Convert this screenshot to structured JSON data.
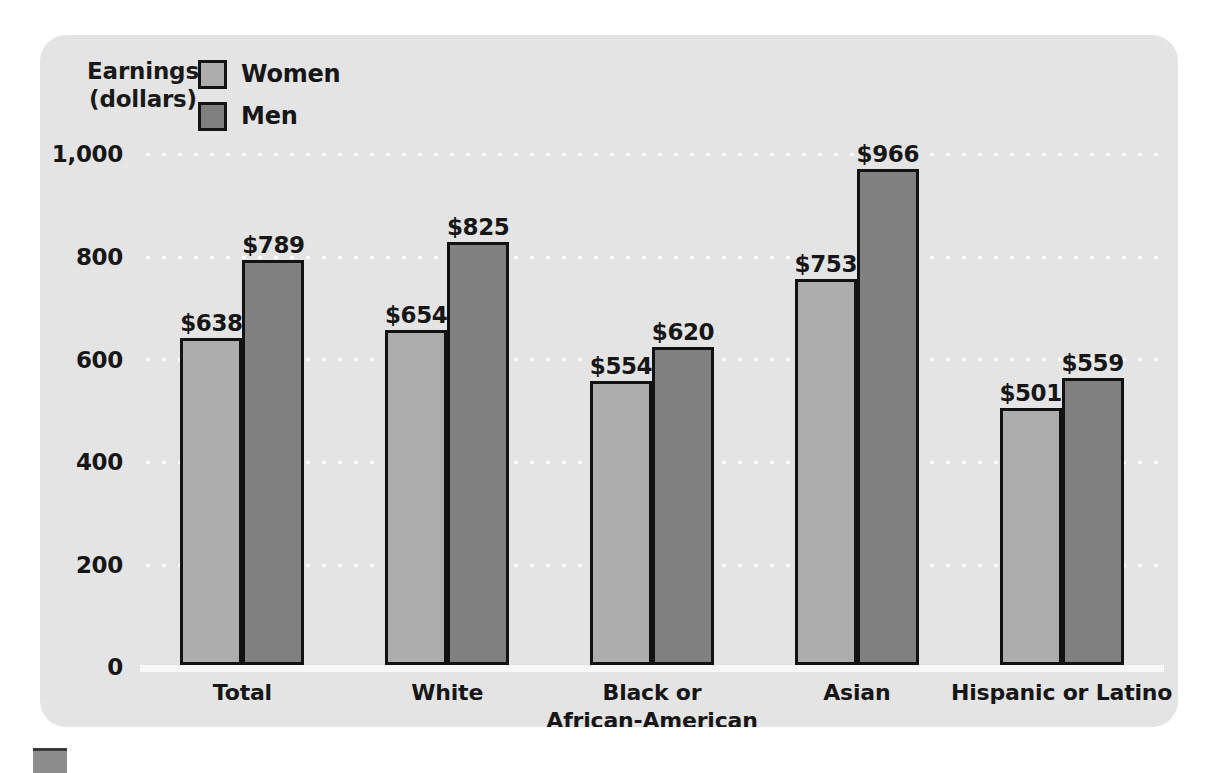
{
  "figure": {
    "panel_background": "#e7e7e7",
    "page_background": "#ffffff",
    "marker_name": "figure-bullet-marker"
  },
  "axis_title": {
    "line1": "Earnings",
    "line2": "(dollars)"
  },
  "legend": {
    "position": "top-left-inside",
    "items": [
      {
        "label": "Women",
        "color": "#afafaf",
        "border": "#101010"
      },
      {
        "label": "Men",
        "color": "#808080",
        "border": "#101010"
      }
    ]
  },
  "chart_data": {
    "type": "bar",
    "title": "",
    "subtitle": "",
    "xlabel": "",
    "ylabel": "Earnings (dollars)",
    "ylim": [
      0,
      1000
    ],
    "yticks": [
      "0",
      "200",
      "400",
      "600",
      "800",
      "1,000"
    ],
    "ytick_values": [
      0,
      200,
      400,
      600,
      800,
      1000
    ],
    "grid": true,
    "grid_style": "white-dotted-horizontal",
    "legend_position": "top-left",
    "categories": [
      "Total",
      "White",
      "Black or\nAfrican-American",
      "Asian",
      "Hispanic or Latino"
    ],
    "category_lines": [
      [
        "Total"
      ],
      [
        "White"
      ],
      [
        "Black or",
        "African-American"
      ],
      [
        "Asian"
      ],
      [
        "Hispanic or Latino"
      ]
    ],
    "series": [
      {
        "name": "Women",
        "color": "#afafaf",
        "values": [
          638,
          654,
          554,
          753,
          501
        ],
        "labels": [
          "$638",
          "$654",
          "$554",
          "$753",
          "$501"
        ]
      },
      {
        "name": "Men",
        "color": "#808080",
        "values": [
          789,
          825,
          620,
          966,
          559
        ],
        "labels": [
          "$789",
          "$825",
          "$620",
          "$966",
          "$559"
        ]
      }
    ]
  }
}
